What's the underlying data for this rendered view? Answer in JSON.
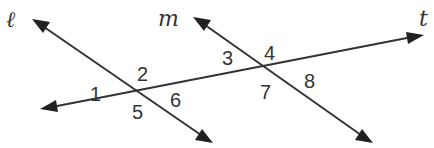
{
  "diagram": {
    "lines": [
      {
        "name": "l",
        "label": "ℓ",
        "from": [
          32,
          19
        ],
        "to": [
          213,
          143
        ],
        "label_pos": [
          6,
          27
        ]
      },
      {
        "name": "m",
        "label": "m",
        "from": [
          193,
          17
        ],
        "to": [
          373,
          143
        ],
        "label_pos": [
          158,
          26
        ]
      },
      {
        "name": "t",
        "label": "t",
        "from": [
          40,
          109
        ],
        "to": [
          424,
          35
        ],
        "label_pos": [
          419,
          26
        ]
      }
    ],
    "angles": [
      {
        "label": "1",
        "pos": [
          90,
          101
        ]
      },
      {
        "label": "2",
        "pos": [
          137,
          81
        ]
      },
      {
        "label": "3",
        "pos": [
          222,
          65
        ]
      },
      {
        "label": "4",
        "pos": [
          264,
          60
        ]
      },
      {
        "label": "5",
        "pos": [
          132,
          119
        ]
      },
      {
        "label": "6",
        "pos": [
          170,
          107
        ]
      },
      {
        "label": "7",
        "pos": [
          260,
          99
        ]
      },
      {
        "label": "8",
        "pos": [
          304,
          88
        ]
      }
    ],
    "stroke_color": "#333333",
    "background": "#ffffff"
  }
}
